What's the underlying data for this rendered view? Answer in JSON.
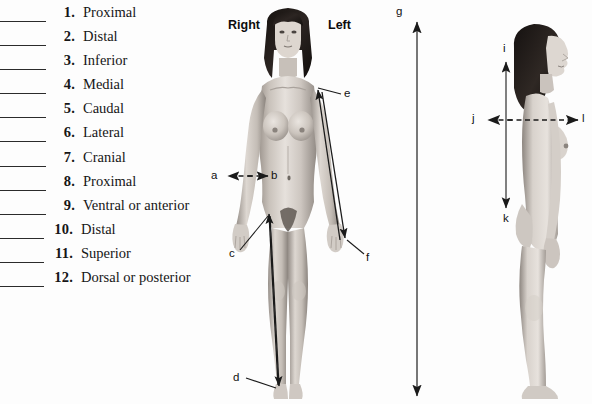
{
  "page": {
    "background_color": "#fdfdfd",
    "width": 592,
    "height": 404
  },
  "answer_list": {
    "items": [
      {
        "number": "1.",
        "label": "Proximal"
      },
      {
        "number": "2.",
        "label": "Distal"
      },
      {
        "number": "3.",
        "label": "Inferior"
      },
      {
        "number": "4.",
        "label": "Medial"
      },
      {
        "number": "5.",
        "label": "Caudal"
      },
      {
        "number": "6.",
        "label": "Lateral"
      },
      {
        "number": "7.",
        "label": "Cranial"
      },
      {
        "number": "8.",
        "label": "Proximal"
      },
      {
        "number": "9.",
        "label": "Ventral or anterior"
      },
      {
        "number": "10.",
        "label": "Distal"
      },
      {
        "number": "11.",
        "label": "Superior"
      },
      {
        "number": "12.",
        "label": "Dorsal or posterior"
      }
    ]
  },
  "anterior_figure": {
    "view": "anterior-female-body",
    "side_labels": {
      "right": "Right",
      "left": "Left"
    },
    "markers": [
      {
        "id": "a",
        "letter": "a"
      },
      {
        "id": "b",
        "letter": "b"
      },
      {
        "id": "c",
        "letter": "c"
      },
      {
        "id": "d",
        "letter": "d"
      },
      {
        "id": "e",
        "letter": "e"
      },
      {
        "id": "f",
        "letter": "f"
      }
    ]
  },
  "full_height_axis": {
    "markers": [
      {
        "id": "g",
        "letter": "g"
      }
    ]
  },
  "lateral_figure": {
    "view": "lateral-female-body",
    "markers": [
      {
        "id": "i",
        "letter": "i"
      },
      {
        "id": "j",
        "letter": "j"
      },
      {
        "id": "k",
        "letter": "k"
      },
      {
        "id": "l",
        "letter": "l"
      }
    ]
  },
  "colors": {
    "ink": "#161616",
    "arrow": "#1a1a1a",
    "skin_light": "#e3ded9",
    "skin_mid": "#c2bab3",
    "skin_shadow": "#8e8781",
    "hair": "#241f1d"
  }
}
